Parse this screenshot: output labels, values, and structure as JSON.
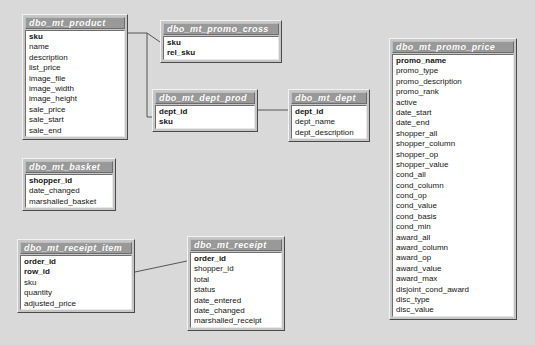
{
  "diagram": {
    "background_color": "#d9d9d9",
    "title_bar_color": "#999999",
    "field_area_color": "#ffffff",
    "box_face_color": "#c6c6c6",
    "line_color": "#555555"
  },
  "tables": [
    {
      "id": "product",
      "name": "dbo_mt_product",
      "x": 22,
      "y": 14,
      "width": 106,
      "fields": [
        {
          "name": "sku",
          "pk": true
        },
        {
          "name": "name",
          "pk": false
        },
        {
          "name": "description",
          "pk": false
        },
        {
          "name": "list_price",
          "pk": false
        },
        {
          "name": "image_file",
          "pk": false
        },
        {
          "name": "image_width",
          "pk": false
        },
        {
          "name": "image_height",
          "pk": false
        },
        {
          "name": "sale_price",
          "pk": false
        },
        {
          "name": "sale_start",
          "pk": false
        },
        {
          "name": "sale_end",
          "pk": false
        }
      ]
    },
    {
      "id": "promo_cross",
      "name": "dbo_mt_promo_cross",
      "x": 160,
      "y": 20,
      "width": 122,
      "fields": [
        {
          "name": "sku",
          "pk": true
        },
        {
          "name": "rel_sku",
          "pk": true
        }
      ]
    },
    {
      "id": "dept_prod",
      "name": "dbo_mt_dept_prod",
      "x": 152,
      "y": 89,
      "width": 106,
      "fields": [
        {
          "name": "dept_id",
          "pk": true
        },
        {
          "name": "sku",
          "pk": true
        }
      ]
    },
    {
      "id": "dept",
      "name": "dbo_mt_dept",
      "x": 288,
      "y": 89,
      "width": 82,
      "fields": [
        {
          "name": "dept_id",
          "pk": true
        },
        {
          "name": "dept_name",
          "pk": false
        },
        {
          "name": "dept_description",
          "pk": false
        }
      ]
    },
    {
      "id": "promo_price",
      "name": "dbo_mt_promo_price",
      "x": 389,
      "y": 38,
      "width": 128,
      "fields": [
        {
          "name": "promo_name",
          "pk": true
        },
        {
          "name": "promo_type",
          "pk": false
        },
        {
          "name": "promo_description",
          "pk": false
        },
        {
          "name": "promo_rank",
          "pk": false
        },
        {
          "name": "active",
          "pk": false
        },
        {
          "name": "date_start",
          "pk": false
        },
        {
          "name": "date_end",
          "pk": false
        },
        {
          "name": "shopper_all",
          "pk": false
        },
        {
          "name": "shopper_column",
          "pk": false
        },
        {
          "name": "shopper_op",
          "pk": false
        },
        {
          "name": "shopper_value",
          "pk": false
        },
        {
          "name": "cond_all",
          "pk": false
        },
        {
          "name": "cond_column",
          "pk": false
        },
        {
          "name": "cond_op",
          "pk": false
        },
        {
          "name": "cond_value",
          "pk": false
        },
        {
          "name": "cond_basis",
          "pk": false
        },
        {
          "name": "cond_min",
          "pk": false
        },
        {
          "name": "award_all",
          "pk": false
        },
        {
          "name": "award_column",
          "pk": false
        },
        {
          "name": "award_op",
          "pk": false
        },
        {
          "name": "award_value",
          "pk": false
        },
        {
          "name": "award_max",
          "pk": false
        },
        {
          "name": "disjoint_cond_award",
          "pk": false
        },
        {
          "name": "disc_type",
          "pk": false
        },
        {
          "name": "disc_value",
          "pk": false
        }
      ]
    },
    {
      "id": "basket",
      "name": "dbo_mt_basket",
      "x": 22,
      "y": 158,
      "width": 94,
      "fields": [
        {
          "name": "shopper_id",
          "pk": true
        },
        {
          "name": "date_changed",
          "pk": false
        },
        {
          "name": "marshalled_basket",
          "pk": false
        }
      ]
    },
    {
      "id": "receipt_item",
      "name": "dbo_mt_receipt_item",
      "x": 17,
      "y": 239,
      "width": 118,
      "fields": [
        {
          "name": "order_id",
          "pk": true
        },
        {
          "name": "row_id",
          "pk": true
        },
        {
          "name": "sku",
          "pk": false
        },
        {
          "name": "quantity",
          "pk": false
        },
        {
          "name": "adjusted_price",
          "pk": false
        }
      ]
    },
    {
      "id": "receipt",
      "name": "dbo_mt_receipt",
      "x": 187,
      "y": 236,
      "width": 98,
      "fields": [
        {
          "name": "order_id",
          "pk": true
        },
        {
          "name": "shopper_id",
          "pk": false
        },
        {
          "name": "total",
          "pk": false
        },
        {
          "name": "status",
          "pk": false
        },
        {
          "name": "date_entered",
          "pk": false
        },
        {
          "name": "date_changed",
          "pk": false
        },
        {
          "name": "marshalled_receipt",
          "pk": false
        }
      ]
    }
  ],
  "relationships": [
    {
      "id": "product-promo_cross",
      "from": "product",
      "to": "promo_cross",
      "points": "128,33 147,33 160,42"
    },
    {
      "id": "product-dept_prod",
      "from": "product",
      "to": "dept_prod",
      "points": "147,33 147,117 152,117"
    },
    {
      "id": "dept_prod-dept",
      "from": "dept_prod",
      "to": "dept",
      "points": "258,110 288,110"
    },
    {
      "id": "receipt_item-receipt",
      "from": "receipt_item",
      "to": "receipt",
      "points": "135,272 187,261"
    }
  ]
}
